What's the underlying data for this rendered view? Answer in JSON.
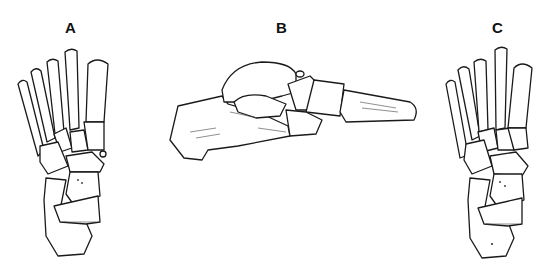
{
  "figure": {
    "panels": [
      {
        "label": "A",
        "view": "dorsal-view-foot-skeleton"
      },
      {
        "label": "B",
        "view": "lateral-view-foot-skeleton"
      },
      {
        "label": "C",
        "view": "dorsal-view-foot-skeleton"
      }
    ]
  }
}
